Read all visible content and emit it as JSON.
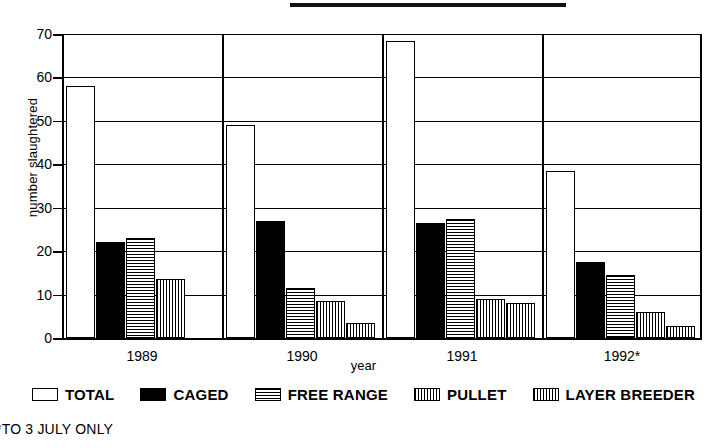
{
  "footnote": "*TO 3 JULY ONLY",
  "legend": {
    "items": [
      {
        "label": "TOTAL",
        "pattern": "solid-white"
      },
      {
        "label": "CAGED",
        "pattern": "solid-black"
      },
      {
        "label": "FREE RANGE",
        "pattern": "horizontal-lines"
      },
      {
        "label": "PULLET",
        "pattern": "vertical-lines"
      },
      {
        "label": "LAYER BREEDER",
        "pattern": "cross-hatch"
      }
    ]
  },
  "chart_data": {
    "type": "bar",
    "title": "",
    "xlabel": "year",
    "ylabel": "number slaughtered",
    "categories": [
      "1989",
      "1990",
      "1991",
      "1992*"
    ],
    "ylim": [
      0,
      70
    ],
    "yticks": [
      0,
      10,
      20,
      30,
      40,
      50,
      60,
      70
    ],
    "grid": true,
    "legend_position": "bottom",
    "series": [
      {
        "name": "TOTAL",
        "values": [
          58,
          49,
          68.5,
          38.5
        ]
      },
      {
        "name": "CAGED",
        "values": [
          22,
          27,
          26.5,
          17.5
        ]
      },
      {
        "name": "FREE RANGE",
        "values": [
          23,
          11.5,
          27.5,
          14.5
        ]
      },
      {
        "name": "PULLET",
        "values": [
          13.5,
          8.5,
          9,
          6
        ]
      },
      {
        "name": "LAYER BREEDER",
        "values": [
          0,
          3.5,
          8,
          2.7
        ]
      }
    ]
  }
}
